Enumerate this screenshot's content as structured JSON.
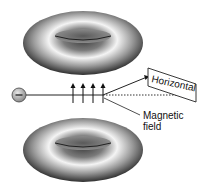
{
  "diagram": {
    "labels": {
      "horizontal": "Horizontal",
      "magnetic_line1": "Magnetic",
      "magnetic_line2": "field"
    },
    "particle": {
      "sign": "−"
    },
    "field_arrows": 4,
    "colors": {
      "torus_dark": "#3a3a3a",
      "torus_light": "#f5f5f5",
      "line": "#222222",
      "particle_fill": "#bdbdbd"
    }
  }
}
